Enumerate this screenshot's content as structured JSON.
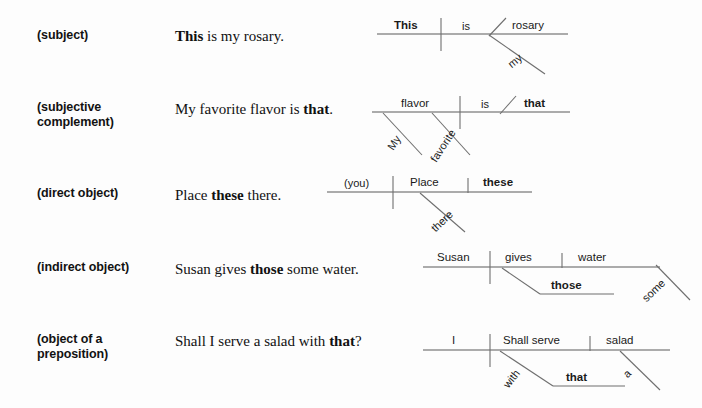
{
  "document": {
    "type": "grammar-reference-sentence-diagrams",
    "background_color": "#fdfdfd",
    "line_color": "#6f6f6f",
    "text_color": "#111111"
  },
  "rows": [
    {
      "role_label": "(subject)",
      "sentence_plain": "This is my rosary.",
      "sentence_parts": [
        {
          "text": "This",
          "bold": true
        },
        {
          "text": " is my rosary.",
          "bold": false
        }
      ],
      "diagram": {
        "subject": "This",
        "verb": "is",
        "complement": "rosary",
        "modifiers": [
          {
            "word": "my",
            "attaches_to": "rosary"
          }
        ]
      }
    },
    {
      "role_label": "(subjective\ncomplement)",
      "sentence_plain": "My favorite flavor is that.",
      "sentence_parts": [
        {
          "text": "My favorite flavor is ",
          "bold": false
        },
        {
          "text": "that",
          "bold": true
        },
        {
          "text": ".",
          "bold": false
        }
      ],
      "diagram": {
        "subject": "flavor",
        "verb": "is",
        "complement": "that",
        "modifiers": [
          {
            "word": "My",
            "attaches_to": "flavor"
          },
          {
            "word": "favorite",
            "attaches_to": "flavor"
          }
        ]
      }
    },
    {
      "role_label": "(direct object)",
      "sentence_plain": "Place these there.",
      "sentence_parts": [
        {
          "text": "Place ",
          "bold": false
        },
        {
          "text": "these",
          "bold": true
        },
        {
          "text": " there.",
          "bold": false
        }
      ],
      "diagram": {
        "subject": "(you)",
        "verb": "Place",
        "direct_object": "these",
        "modifiers": [
          {
            "word": "there",
            "attaches_to": "Place"
          }
        ]
      }
    },
    {
      "role_label": "(indirect object)",
      "sentence_plain": "Susan gives those some water.",
      "sentence_parts": [
        {
          "text": "Susan gives ",
          "bold": false
        },
        {
          "text": "those",
          "bold": true
        },
        {
          "text": " some water.",
          "bold": false
        }
      ],
      "diagram": {
        "subject": "Susan",
        "verb": "gives",
        "direct_object": "water",
        "indirect_object": "those",
        "modifiers": [
          {
            "word": "some",
            "attaches_to": "water"
          }
        ]
      }
    },
    {
      "role_label": "(object of a\npreposition)",
      "sentence_plain": "Shall I serve a salad with that?",
      "sentence_parts": [
        {
          "text": "Shall I serve a salad with ",
          "bold": false
        },
        {
          "text": "that",
          "bold": true
        },
        {
          "text": "?",
          "bold": false
        }
      ],
      "diagram": {
        "subject": "I",
        "verb": "Shall serve",
        "direct_object": "salad",
        "preposition": "with",
        "object_of_preposition": "that",
        "modifiers": [
          {
            "word": "a",
            "attaches_to": "salad"
          }
        ]
      }
    }
  ],
  "labels": {
    "row1_role": "(subject)",
    "row2_role": "(subjective\ncomplement)",
    "row3_role": "(direct object)",
    "row4_role": "(indirect object)",
    "row5_role": "(object of a\npreposition)",
    "d1_subject": "This",
    "d1_verb": "is",
    "d1_complement": "rosary",
    "d1_mod_my": "my",
    "d2_subject": "flavor",
    "d2_verb": "is",
    "d2_complement": "that",
    "d2_mod_my": "My",
    "d2_mod_favorite": "favorite",
    "d3_subject": "(you)",
    "d3_verb": "Place",
    "d3_object": "these",
    "d3_mod_there": "there",
    "d4_subject": "Susan",
    "d4_verb": "gives",
    "d4_object": "water",
    "d4_indirect": "those",
    "d4_mod_some": "some",
    "d5_subject": "I",
    "d5_verb": "Shall serve",
    "d5_object": "salad",
    "d5_prep": "with",
    "d5_prep_object": "that",
    "d5_mod_a": "a"
  }
}
